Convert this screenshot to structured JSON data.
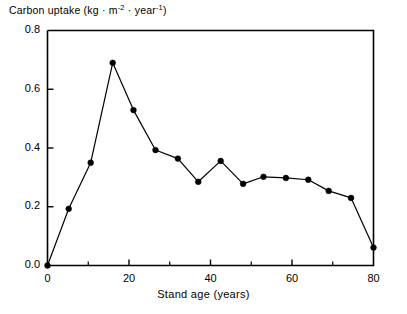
{
  "chart_data": {
    "type": "line",
    "title": "",
    "ylabel": "Carbon uptake (kg · m⁻² · year⁻¹)",
    "ylabel_parts": {
      "main": "Carbon uptake (kg · m",
      "sup1": "-2",
      "mid": " · year",
      "sup2": "-1",
      "end": ")"
    },
    "xlabel": "Stand age (years)",
    "xlim": [
      0,
      80
    ],
    "ylim": [
      0.0,
      0.8
    ],
    "xticks": [
      0,
      20,
      40,
      60,
      80
    ],
    "xtick_labels": [
      "0",
      "20",
      "40",
      "60",
      "80"
    ],
    "xminor_ticks": [
      10,
      30,
      50,
      70
    ],
    "yticks": [
      0.0,
      0.2,
      0.4,
      0.6,
      0.8
    ],
    "ytick_labels": [
      "0.0",
      "0.2",
      "0.4",
      "0.6",
      "0.8"
    ],
    "grid": false,
    "legend": null,
    "marker": "filled-circle",
    "marker_color": "#000000",
    "line_color": "#000000",
    "x": [
      0,
      5.2,
      10.6,
      16.0,
      21.1,
      26.5,
      32.0,
      37.0,
      42.5,
      48.0,
      53.0,
      58.5,
      64.0,
      69.0,
      74.5,
      80.0
    ],
    "y": [
      0.0,
      0.193,
      0.35,
      0.69,
      0.529,
      0.393,
      0.364,
      0.285,
      0.356,
      0.278,
      0.302,
      0.298,
      0.292,
      0.254,
      0.23,
      0.061
    ],
    "series": [
      {
        "name": "Carbon uptake",
        "points": [
          {
            "x": 0,
            "y": 0.0
          },
          {
            "x": 5.2,
            "y": 0.193
          },
          {
            "x": 10.6,
            "y": 0.35
          },
          {
            "x": 16.0,
            "y": 0.69
          },
          {
            "x": 21.1,
            "y": 0.529
          },
          {
            "x": 26.5,
            "y": 0.393
          },
          {
            "x": 32.0,
            "y": 0.364
          },
          {
            "x": 37.0,
            "y": 0.285
          },
          {
            "x": 42.5,
            "y": 0.356
          },
          {
            "x": 48.0,
            "y": 0.278
          },
          {
            "x": 53.0,
            "y": 0.302
          },
          {
            "x": 58.5,
            "y": 0.298
          },
          {
            "x": 64.0,
            "y": 0.292
          },
          {
            "x": 69.0,
            "y": 0.254
          },
          {
            "x": 74.5,
            "y": 0.23
          },
          {
            "x": 80.0,
            "y": 0.061
          }
        ]
      }
    ]
  }
}
